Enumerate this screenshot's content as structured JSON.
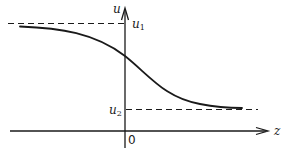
{
  "diagram": {
    "title": "",
    "axes": {
      "vertical_label": "u",
      "horizontal_label": "z",
      "origin_label": "0"
    },
    "levels": {
      "upper": {
        "base": "u",
        "sub": "1"
      },
      "lower": {
        "base": "u",
        "sub": "2"
      }
    },
    "curve": {
      "description": "monotonically decreasing smooth transition from u1 (left) to u2 (right)",
      "type": "kink"
    },
    "colors": {
      "ink": "#1a1a1a",
      "background": "#ffffff"
    }
  }
}
